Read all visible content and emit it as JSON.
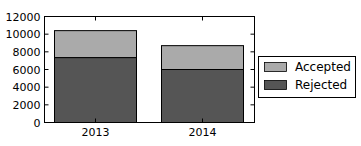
{
  "chart_data": {
    "type": "bar",
    "stacked": true,
    "title": "",
    "xlabel": "",
    "ylabel": "",
    "categories": [
      "2013",
      "2014"
    ],
    "series": [
      {
        "name": "Rejected",
        "values": [
          7350,
          6000
        ],
        "color": "#555555"
      },
      {
        "name": "Accepted",
        "values": [
          3050,
          2700
        ],
        "color": "#aaaaaa"
      }
    ],
    "totals": [
      10400,
      8700
    ],
    "ylim": [
      0,
      12000
    ],
    "yticks": [
      0,
      2000,
      4000,
      6000,
      8000,
      10000,
      12000
    ],
    "grid": false,
    "legend": {
      "position": "right",
      "entries": [
        {
          "label": "Accepted",
          "color": "#aaaaaa"
        },
        {
          "label": "Rejected",
          "color": "#555555"
        }
      ]
    }
  }
}
